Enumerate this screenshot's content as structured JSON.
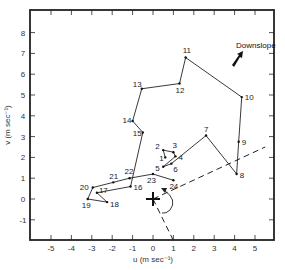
{
  "chart_data": {
    "type": "line",
    "title": "",
    "xlabel": "u (m sec⁻¹)",
    "ylabel": "v (m sec⁻¹)",
    "xlim": [
      -6,
      6
    ],
    "ylim": [
      -2,
      9
    ],
    "xticks": [
      -5,
      -4,
      -3,
      -2,
      -1,
      0,
      1,
      2,
      3,
      4,
      5
    ],
    "yticks": [
      -1,
      0,
      1,
      2,
      3,
      4,
      5,
      6,
      7,
      8
    ],
    "grid": false,
    "legend": null,
    "series": [
      {
        "name": "hodograph",
        "points": [
          {
            "label": "1",
            "u": 0.6,
            "v": 2.0
          },
          {
            "label": "2",
            "u": 0.5,
            "v": 2.35
          },
          {
            "label": "3",
            "u": 1.0,
            "v": 2.25
          },
          {
            "label": "4",
            "u": 1.1,
            "v": 2.05
          },
          {
            "label": "5",
            "u": 0.5,
            "v": 1.55
          },
          {
            "label": "6",
            "u": 0.9,
            "v": 1.7
          },
          {
            "label": "7",
            "u": 2.6,
            "v": 3.05
          },
          {
            "label": "8",
            "u": 4.1,
            "v": 1.2
          },
          {
            "label": "9",
            "u": 4.2,
            "v": 2.75
          },
          {
            "label": "10",
            "u": 4.35,
            "v": 4.9
          },
          {
            "label": "11",
            "u": 1.6,
            "v": 6.8
          },
          {
            "label": "12",
            "u": 1.3,
            "v": 5.55
          },
          {
            "label": "13",
            "u": -0.55,
            "v": 5.3
          },
          {
            "label": "14",
            "u": -1.0,
            "v": 3.75
          },
          {
            "label": "15",
            "u": -0.5,
            "v": 3.2
          },
          {
            "label": "16",
            "u": -1.1,
            "v": 0.6
          },
          {
            "label": "17",
            "u": -2.75,
            "v": 0.3
          },
          {
            "label": "18",
            "u": -2.25,
            "v": -0.15
          },
          {
            "label": "19",
            "u": -3.2,
            "v": 0.0
          },
          {
            "label": "20",
            "u": -2.95,
            "v": 0.55
          },
          {
            "label": "21",
            "u": -1.95,
            "v": 0.8
          },
          {
            "label": "22",
            "u": -1.15,
            "v": 1.0
          },
          {
            "label": "23",
            "u": 0.0,
            "v": 1.2
          },
          {
            "label": "24",
            "u": 1.0,
            "v": 0.9
          }
        ]
      }
    ],
    "annotations": [
      {
        "text": "Downslope",
        "u": 3.8,
        "v": 7.1,
        "arrow": "pointing down-left"
      },
      {
        "text": "+",
        "u": 0.0,
        "v": 0.0,
        "note": "origin marker"
      },
      {
        "type": "dashed-line",
        "from": [
          0,
          0
        ],
        "to": [
          5.5,
          2.5
        ]
      },
      {
        "type": "dashed-line",
        "from": [
          0,
          0
        ],
        "to": [
          1.0,
          -2.0
        ]
      },
      {
        "type": "arc-arrow",
        "note": "rotation arc between dashed lines, clockwise"
      }
    ]
  },
  "labels": {
    "downslope": "Downslope",
    "xlabel": "u (m sec⁻¹)",
    "ylabel": "v (m sec⁻¹)"
  }
}
